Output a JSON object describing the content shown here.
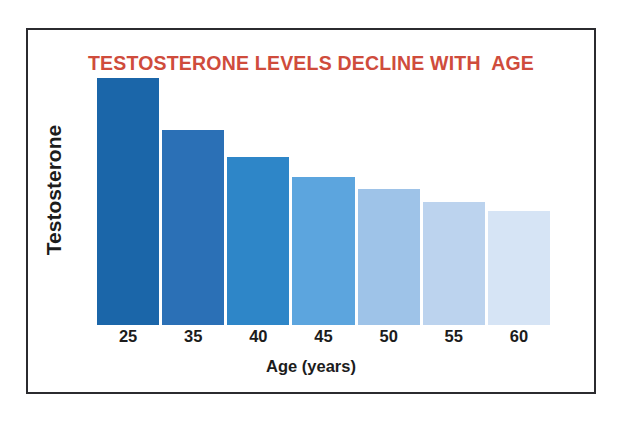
{
  "chart_data": {
    "type": "bar",
    "title": "TESTOSTERONE LEVELS DECLINE WITH  AGE",
    "xlabel": "Age (years)",
    "ylabel": "Testosterone",
    "categories": [
      "25",
      "35",
      "40",
      "45",
      "50",
      "55",
      "60"
    ],
    "values": [
      100,
      79,
      68,
      60,
      55,
      50,
      46
    ],
    "ylim": [
      0,
      100
    ],
    "grid": false,
    "legend": "none",
    "axis_ticks_y": "none",
    "bar_colors": [
      "#1b66a9",
      "#2b70b6",
      "#2e86c8",
      "#5ca5de",
      "#9ec3e8",
      "#bcd3ee",
      "#d6e4f5"
    ],
    "series": [
      {
        "name": "Testosterone",
        "values": [
          100,
          79,
          68,
          60,
          55,
          50,
          46
        ]
      }
    ],
    "points": [
      {
        "category": "25",
        "value": 100,
        "color": "#1b66a9"
      },
      {
        "category": "35",
        "value": 79,
        "color": "#2b70b6"
      },
      {
        "category": "40",
        "value": 68,
        "color": "#2e86c8"
      },
      {
        "category": "45",
        "value": 60,
        "color": "#5ca5de"
      },
      {
        "category": "50",
        "value": 55,
        "color": "#9ec3e8"
      },
      {
        "category": "55",
        "value": 50,
        "color": "#bcd3ee"
      },
      {
        "category": "60",
        "value": 46,
        "color": "#d6e4f5"
      }
    ]
  },
  "colors": {
    "title": "#cf4c3c",
    "frame_border": "#2b2b2f",
    "text": "#1c1c1c",
    "background": "#ffffff"
  }
}
